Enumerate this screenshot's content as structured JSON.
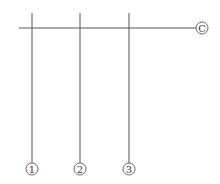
{
  "diagram": {
    "type": "structural-axis-grid",
    "horizontal_axes": [
      {
        "label": "C",
        "y": 28,
        "x1": 19,
        "x2": 196,
        "bubble_x": 202
      }
    ],
    "vertical_axes": [
      {
        "label": "1",
        "x": 32,
        "y1": 13,
        "y2": 163,
        "bubble_y": 169
      },
      {
        "label": "2",
        "x": 80,
        "y1": 13,
        "y2": 163,
        "bubble_y": 169
      },
      {
        "label": "3",
        "x": 129,
        "y1": 13,
        "y2": 163,
        "bubble_y": 169
      }
    ],
    "colors": {
      "line": "#555555",
      "text": "#333333",
      "background": "#ffffff"
    }
  }
}
